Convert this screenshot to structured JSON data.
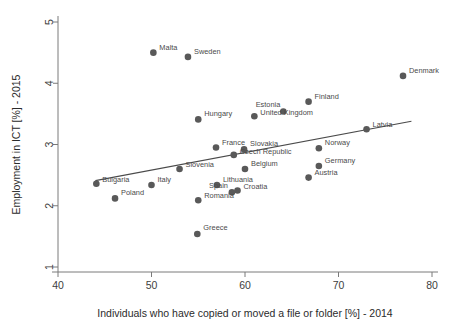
{
  "chart_data": {
    "type": "scatter",
    "title": "",
    "xlabel": "Individuals who have copied or moved a file or folder [%] - 2014",
    "ylabel": "Employment in ICT [%] - 2015",
    "xlim": [
      40,
      80
    ],
    "ylim": [
      1,
      5
    ],
    "xticks": [
      40,
      50,
      60,
      70,
      80
    ],
    "yticks": [
      1,
      2,
      3,
      4,
      5
    ],
    "grid": false,
    "legend": "none",
    "marker_color": "#595959",
    "line_color": "#4a4a4a",
    "trendline": {
      "label": "linear fit",
      "x0": 44.0,
      "y0": 2.41,
      "x1": 77.8,
      "y1": 3.38
    },
    "points": [
      {
        "label": "Malta",
        "x": 50.2,
        "y": 4.5,
        "label_dx": 6,
        "label_dy": -3
      },
      {
        "label": "Sweden",
        "x": 53.9,
        "y": 4.43,
        "label_dx": 6,
        "label_dy": -3
      },
      {
        "label": "Denmark",
        "x": 76.9,
        "y": 4.12,
        "label_dx": 6,
        "label_dy": -3
      },
      {
        "label": "Finland",
        "x": 66.8,
        "y": 3.7,
        "label_dx": 6,
        "label_dy": -3
      },
      {
        "label": "Estonia",
        "x": 64.1,
        "y": 3.54,
        "label_dx": -3,
        "label_dy": -4
      },
      {
        "label": "United Kingdom",
        "x": 61.0,
        "y": 3.46,
        "label_dx": 6,
        "label_dy": -1
      },
      {
        "label": "Hungary",
        "x": 55.0,
        "y": 3.41,
        "label_dx": 6,
        "label_dy": -3
      },
      {
        "label": "Latvia",
        "x": 73.0,
        "y": 3.25,
        "label_dx": 6,
        "label_dy": -2
      },
      {
        "label": "France",
        "x": 56.9,
        "y": 2.95,
        "label_dx": 6,
        "label_dy": -3
      },
      {
        "label": "Slovakia",
        "x": 59.9,
        "y": 2.92,
        "label_dx": 6,
        "label_dy": -3
      },
      {
        "label": "Norway",
        "x": 67.9,
        "y": 2.94,
        "label_dx": 6,
        "label_dy": -3
      },
      {
        "label": "Czech Republic",
        "x": 58.8,
        "y": 2.83,
        "label_dx": 6,
        "label_dy": -1
      },
      {
        "label": "Germany",
        "x": 67.9,
        "y": 2.65,
        "label_dx": 6,
        "label_dy": -3
      },
      {
        "label": "Slovenia",
        "x": 53.0,
        "y": 2.6,
        "label_dx": 6,
        "label_dy": -2
      },
      {
        "label": "Belgium",
        "x": 60.0,
        "y": 2.6,
        "label_dx": 6,
        "label_dy": -3
      },
      {
        "label": "Austria",
        "x": 66.8,
        "y": 2.46,
        "label_dx": 6,
        "label_dy": -3
      },
      {
        "label": "Bulgaria",
        "x": 44.1,
        "y": 2.36,
        "label_dx": 6,
        "label_dy": -2
      },
      {
        "label": "Italy",
        "x": 50.0,
        "y": 2.34,
        "label_dx": 6,
        "label_dy": -3
      },
      {
        "label": "Lithuania",
        "x": 57.0,
        "y": 2.34,
        "label_dx": 6,
        "label_dy": -3
      },
      {
        "label": "Croatia",
        "x": 59.2,
        "y": 2.25,
        "label_dx": 6,
        "label_dy": -1
      },
      {
        "label": "Spain",
        "x": 58.6,
        "y": 2.22,
        "label_dx": -4,
        "label_dy": -4
      },
      {
        "label": "Poland",
        "x": 46.1,
        "y": 2.12,
        "label_dx": 6,
        "label_dy": -3
      },
      {
        "label": "Romania",
        "x": 55.0,
        "y": 2.09,
        "label_dx": 6,
        "label_dy": -2
      },
      {
        "label": "Greece",
        "x": 54.9,
        "y": 1.54,
        "label_dx": 6,
        "label_dy": -4
      }
    ]
  }
}
